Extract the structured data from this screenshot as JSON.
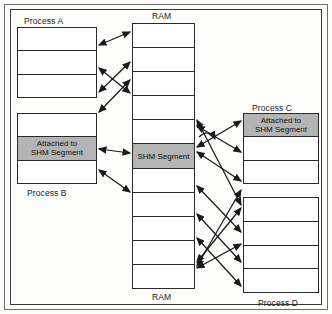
{
  "figure": {
    "title_top": "RAM",
    "title_bottom": "RAM"
  },
  "labels": {
    "process_a": "Process A",
    "process_b": "Process B",
    "process_c": "Process C",
    "process_d": "Process D",
    "ram_top": "RAM",
    "ram_bottom": "RAM",
    "attached": "Attached to\nSHM Segment",
    "shm_segment": "SHM Segment",
    "empty": ""
  },
  "colors": {
    "shaded_cell": "#b4b4b4",
    "cell_fill": "#ffffff",
    "stroke": "#2a2a2a",
    "page": "#fbfbfa",
    "arrow": "#1a1a1a"
  },
  "blocks": {
    "process_a": {
      "name": "Process A",
      "caption_position": "top",
      "cells": [
        {
          "text": "",
          "shaded": false
        },
        {
          "text": "",
          "shaded": false
        },
        {
          "text": "",
          "shaded": false
        }
      ]
    },
    "process_b": {
      "name": "Process B",
      "caption_position": "bottom",
      "cells": [
        {
          "text": "",
          "shaded": false
        },
        {
          "text": "Attached to\nSHM Segment",
          "shaded": true
        },
        {
          "text": "",
          "shaded": false
        }
      ]
    },
    "ram": {
      "name": "RAM",
      "caption_position": "both",
      "cells": [
        {
          "text": "",
          "shaded": false
        },
        {
          "text": "",
          "shaded": false
        },
        {
          "text": "",
          "shaded": false
        },
        {
          "text": "",
          "shaded": false
        },
        {
          "text": "",
          "shaded": false
        },
        {
          "text": "SHM Segment",
          "shaded": true
        },
        {
          "text": "",
          "shaded": false
        },
        {
          "text": "",
          "shaded": false
        },
        {
          "text": "",
          "shaded": false
        },
        {
          "text": "",
          "shaded": false
        },
        {
          "text": "",
          "shaded": false
        }
      ]
    },
    "process_c": {
      "name": "Process C",
      "caption_position": "top",
      "cells": [
        {
          "text": "Attached to\nSHM Segment",
          "shaded": true
        },
        {
          "text": "",
          "shaded": false
        },
        {
          "text": "",
          "shaded": false
        }
      ]
    },
    "process_d": {
      "name": "Process D",
      "caption_position": "bottom",
      "cells": [
        {
          "text": "",
          "shaded": false
        },
        {
          "text": "",
          "shaded": false
        },
        {
          "text": "",
          "shaded": false
        },
        {
          "text": "",
          "shaded": false
        }
      ]
    }
  },
  "connections": {
    "description": "double-headed arrows linking process memory cells to RAM frames",
    "count": 16
  }
}
